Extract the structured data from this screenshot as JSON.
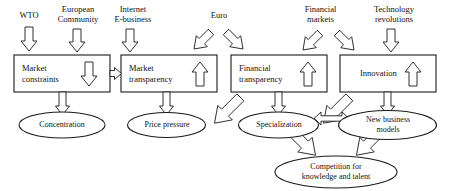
{
  "diagram": {
    "stroke_color": "#1a1a1a",
    "fill_color": "#ffffff",
    "background": "#ffffff",
    "drivers": [
      {
        "id": "wto",
        "label": "WTO",
        "arrow": "down",
        "target": "market-constraints"
      },
      {
        "id": "european-community",
        "label": "European\nCommunity",
        "arrow": "down",
        "target": "market-constraints"
      },
      {
        "id": "internet-ebusiness",
        "label": "Internet\nE-business",
        "arrow": "down",
        "target": "market-transparency"
      },
      {
        "id": "euro",
        "label": "Euro",
        "arrow": "down-left-and-down-right",
        "target": "market-transparency, financial-transparency"
      },
      {
        "id": "financial-markets",
        "label": "Financial\nmarkets",
        "arrow": "down-left",
        "target": "financial-transparency"
      },
      {
        "id": "technology-revolutions",
        "label": "Technology\nrevolutions",
        "arrow": "down",
        "target": "innovation"
      }
    ],
    "extra_driver_arrow": {
      "id": "financial-markets-to-innovation",
      "arrow": "down-right",
      "target": "innovation"
    },
    "boxes": [
      {
        "id": "market-constraints",
        "label": "Market\nconstraints",
        "inner_arrow": "down"
      },
      {
        "id": "market-transparency",
        "label": "Market\ntransparency",
        "inner_arrow": "up"
      },
      {
        "id": "financial-transparency",
        "label": "Financial\ntransparency",
        "inner_arrow": "up"
      },
      {
        "id": "innovation",
        "label": "Innovation",
        "inner_arrow": "up"
      }
    ],
    "box_connector": {
      "id": "constraints-to-transparency",
      "from": "market-constraints",
      "to": "market-transparency",
      "arrow": "right"
    },
    "ovals": [
      {
        "id": "concentration",
        "label": "Concentration"
      },
      {
        "id": "price-pressure",
        "label": "Price pressure"
      },
      {
        "id": "specialization",
        "label": "Specialization"
      },
      {
        "id": "new-business-models",
        "label": "New business\nmodels"
      },
      {
        "id": "competition",
        "label": "Competition for\nknowledge and talent"
      }
    ],
    "oval_connector": {
      "id": "specialization-to-new-business",
      "arrow": "double-headed-horizontal"
    },
    "flows": [
      {
        "from": "market-constraints",
        "to": "concentration",
        "arrow": "down"
      },
      {
        "from": "market-transparency",
        "to": "price-pressure",
        "arrow": "down"
      },
      {
        "from": "financial-transparency",
        "to": "price-pressure",
        "arrow": "down-left"
      },
      {
        "from": "financial-transparency",
        "to": "specialization",
        "arrow": "down"
      },
      {
        "from": "innovation",
        "to": "specialization",
        "arrow": "down-left"
      },
      {
        "from": "innovation",
        "to": "new-business-models",
        "arrow": "down"
      },
      {
        "from": "specialization",
        "to": "competition",
        "arrow": "down-right"
      },
      {
        "from": "new-business-models",
        "to": "competition",
        "arrow": "down-left"
      }
    ]
  }
}
